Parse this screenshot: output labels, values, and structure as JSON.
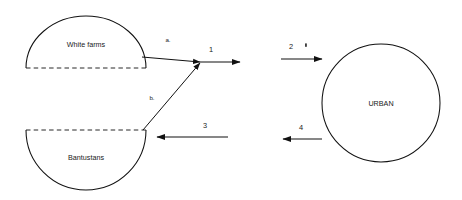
{
  "diagram": {
    "nodes": [
      {
        "id": "white-farms",
        "label": "White farms",
        "shape": "upper-semicircle"
      },
      {
        "id": "bantustans",
        "label": "Bantustans",
        "shape": "lower-semicircle"
      },
      {
        "id": "urban",
        "label": "URBAN",
        "shape": "circle"
      }
    ],
    "flows": [
      {
        "id": "flow-a",
        "label": "a.",
        "from": "white-farms",
        "to": "junction",
        "direction": "down-right"
      },
      {
        "id": "flow-b",
        "label": "b.",
        "from": "bantustans",
        "to": "junction",
        "direction": "up-right"
      },
      {
        "id": "flow-1",
        "label": "1",
        "from": "junction",
        "to": "right",
        "direction": "right"
      },
      {
        "id": "flow-2",
        "label": "2",
        "from": "left",
        "to": "urban",
        "direction": "right"
      },
      {
        "id": "flow-3",
        "label": "3",
        "from": "right",
        "to": "bantustans",
        "direction": "left"
      },
      {
        "id": "flow-4",
        "label": "4",
        "from": "urban",
        "to": "left",
        "direction": "left"
      }
    ],
    "marks": [
      {
        "id": "stray-tick",
        "label": "'"
      }
    ]
  },
  "colors": {
    "stroke": "#111111",
    "text": "#1a1a1a",
    "background": "#ffffff"
  }
}
